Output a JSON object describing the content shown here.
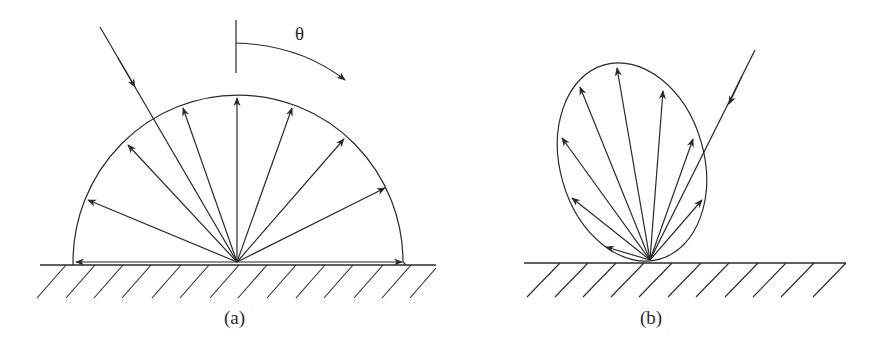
{
  "panels": {
    "a": {
      "label": "(a)",
      "angle_symbol": "θ",
      "shape": "semicircle",
      "description": "Diffuse (Lambertian) reflection: incident ray scattered equally in all directions"
    },
    "b": {
      "label": "(b)",
      "shape": "tilted ellipse lobe",
      "description": "Directional (non-Lambertian) reflection lobe with oblique incident ray"
    }
  },
  "colors": {
    "stroke": "#2a2a2a",
    "background": "#ffffff"
  }
}
